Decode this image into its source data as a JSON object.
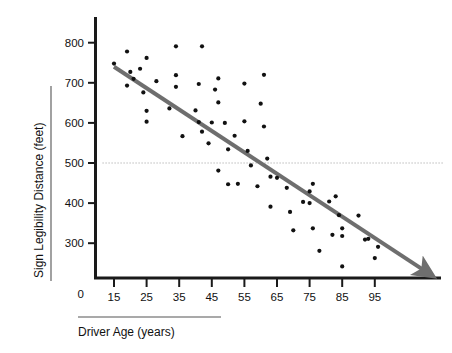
{
  "chart_data": {
    "type": "scatter",
    "title": "",
    "xlabel": "Driver Age (years)",
    "ylabel": "Sign Legibility Distance (feet)",
    "xlim": [
      10,
      110
    ],
    "ylim": [
      200,
      830
    ],
    "xticks": [
      15,
      25,
      35,
      45,
      55,
      65,
      75,
      85,
      95
    ],
    "yticks": [
      300,
      400,
      500,
      600,
      700,
      800
    ],
    "origin_label": "0",
    "grid": false,
    "reference_lines": [
      {
        "name": "legibility-500-reference",
        "orientation": "horizontal",
        "value": 500,
        "style": "dotted",
        "color": "#9a9a9a"
      }
    ],
    "trendline": {
      "name": "regression-trendline",
      "color": "#6e6e6e",
      "width_px": 4,
      "arrow": true,
      "x_start": 15,
      "y_start": 740,
      "x_end": 110,
      "y_end": 233
    },
    "marker": {
      "shape": "circle",
      "color": "#111111",
      "size_px": 4.2
    },
    "points": [
      {
        "x": 15,
        "y": 748
      },
      {
        "x": 19,
        "y": 778
      },
      {
        "x": 19,
        "y": 693
      },
      {
        "x": 20,
        "y": 727
      },
      {
        "x": 21,
        "y": 710
      },
      {
        "x": 23,
        "y": 735
      },
      {
        "x": 24,
        "y": 676
      },
      {
        "x": 25,
        "y": 762
      },
      {
        "x": 25,
        "y": 630
      },
      {
        "x": 25,
        "y": 603
      },
      {
        "x": 28,
        "y": 704
      },
      {
        "x": 32,
        "y": 636
      },
      {
        "x": 34,
        "y": 791
      },
      {
        "x": 34,
        "y": 719
      },
      {
        "x": 34,
        "y": 690
      },
      {
        "x": 36,
        "y": 567
      },
      {
        "x": 40,
        "y": 631
      },
      {
        "x": 41,
        "y": 697
      },
      {
        "x": 41,
        "y": 602
      },
      {
        "x": 42,
        "y": 791
      },
      {
        "x": 42,
        "y": 578
      },
      {
        "x": 44,
        "y": 549
      },
      {
        "x": 45,
        "y": 601
      },
      {
        "x": 46,
        "y": 683
      },
      {
        "x": 47,
        "y": 711
      },
      {
        "x": 47,
        "y": 651
      },
      {
        "x": 47,
        "y": 481
      },
      {
        "x": 49,
        "y": 600
      },
      {
        "x": 50,
        "y": 534
      },
      {
        "x": 50,
        "y": 447
      },
      {
        "x": 52,
        "y": 568
      },
      {
        "x": 53,
        "y": 448
      },
      {
        "x": 55,
        "y": 604
      },
      {
        "x": 55,
        "y": 698
      },
      {
        "x": 56,
        "y": 530
      },
      {
        "x": 57,
        "y": 494
      },
      {
        "x": 59,
        "y": 442
      },
      {
        "x": 60,
        "y": 648
      },
      {
        "x": 61,
        "y": 720
      },
      {
        "x": 61,
        "y": 591
      },
      {
        "x": 62,
        "y": 511
      },
      {
        "x": 63,
        "y": 466
      },
      {
        "x": 63,
        "y": 391
      },
      {
        "x": 65,
        "y": 463
      },
      {
        "x": 68,
        "y": 438
      },
      {
        "x": 69,
        "y": 378
      },
      {
        "x": 70,
        "y": 332
      },
      {
        "x": 73,
        "y": 403
      },
      {
        "x": 75,
        "y": 400
      },
      {
        "x": 75,
        "y": 429
      },
      {
        "x": 76,
        "y": 448
      },
      {
        "x": 76,
        "y": 337
      },
      {
        "x": 78,
        "y": 281
      },
      {
        "x": 81,
        "y": 404
      },
      {
        "x": 82,
        "y": 321
      },
      {
        "x": 83,
        "y": 417
      },
      {
        "x": 84,
        "y": 370
      },
      {
        "x": 85,
        "y": 337
      },
      {
        "x": 85,
        "y": 318
      },
      {
        "x": 85,
        "y": 242
      },
      {
        "x": 90,
        "y": 369
      },
      {
        "x": 92,
        "y": 309
      },
      {
        "x": 93,
        "y": 311
      },
      {
        "x": 95,
        "y": 263
      },
      {
        "x": 96,
        "y": 291
      }
    ]
  },
  "axes": {
    "y_title": "Sign Legibility Distance (feet)",
    "x_title": "Driver Age (years)",
    "origin": "0",
    "x_tick_labels": [
      "15",
      "25",
      "35",
      "45",
      "55",
      "65",
      "75",
      "85",
      "95"
    ],
    "y_tick_labels": [
      "300",
      "400",
      "500",
      "600",
      "700",
      "800"
    ]
  },
  "colors": {
    "axis": "#1a1a1a",
    "marker": "#111111",
    "trendline": "#6e6e6e",
    "reference": "#9a9a9a",
    "rule": "#555555",
    "background": "#ffffff"
  }
}
